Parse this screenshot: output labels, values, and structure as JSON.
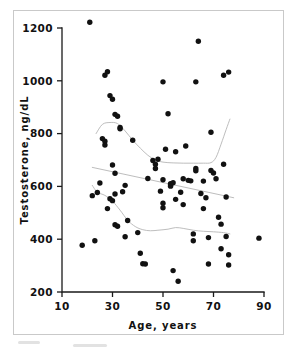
{
  "figure": {
    "type": "scatter-plot",
    "background_color": "#ffffff",
    "frame_color": "#c9c9c9",
    "point_color": "#111111",
    "trend_color": "#b5b5b5"
  },
  "chart_data": {
    "type": "scatter",
    "title": "",
    "xlabel": "Age, years",
    "ylabel": "Testosterone, ng/dL",
    "xlim": [
      10,
      90
    ],
    "ylim": [
      200,
      1200
    ],
    "xticks": [
      10,
      30,
      50,
      70,
      90
    ],
    "yticks": [
      200,
      400,
      600,
      800,
      1000,
      1200
    ],
    "xtick_labels": [
      "10",
      "30",
      "50",
      "70",
      "90"
    ],
    "ytick_labels": [
      "200",
      "400",
      "600",
      "800",
      "1000",
      "1200"
    ],
    "grid": false,
    "legend": "none",
    "marker": "filled-circle",
    "points": [
      [
        21,
        1222
      ],
      [
        18,
        377
      ],
      [
        22,
        565
      ],
      [
        23,
        394
      ],
      [
        24,
        577
      ],
      [
        25,
        613
      ],
      [
        26,
        781
      ],
      [
        27,
        1021
      ],
      [
        27,
        771
      ],
      [
        27,
        757
      ],
      [
        28,
        1034
      ],
      [
        28,
        516
      ],
      [
        29,
        944
      ],
      [
        29,
        553
      ],
      [
        30,
        930
      ],
      [
        30,
        681
      ],
      [
        30,
        546
      ],
      [
        31,
        873
      ],
      [
        31,
        650
      ],
      [
        31,
        571
      ],
      [
        31,
        455
      ],
      [
        32,
        866
      ],
      [
        32,
        449
      ],
      [
        33,
        823
      ],
      [
        33,
        818
      ],
      [
        34,
        580
      ],
      [
        35,
        604
      ],
      [
        35,
        409
      ],
      [
        36,
        471
      ],
      [
        38,
        775
      ],
      [
        40,
        425
      ],
      [
        41,
        347
      ],
      [
        42,
        307
      ],
      [
        43,
        306
      ],
      [
        44,
        630
      ],
      [
        46,
        698
      ],
      [
        47,
        684
      ],
      [
        47,
        668
      ],
      [
        48,
        703
      ],
      [
        49,
        582
      ],
      [
        50,
        996
      ],
      [
        50,
        625
      ],
      [
        50,
        519
      ],
      [
        50,
        536
      ],
      [
        51,
        741
      ],
      [
        52,
        875
      ],
      [
        53,
        610
      ],
      [
        53,
        606
      ],
      [
        53,
        601
      ],
      [
        54,
        614
      ],
      [
        54,
        281
      ],
      [
        55,
        731
      ],
      [
        55,
        551
      ],
      [
        56,
        241
      ],
      [
        57,
        578
      ],
      [
        58,
        629
      ],
      [
        58,
        531
      ],
      [
        59,
        753
      ],
      [
        60,
        623
      ],
      [
        61,
        621
      ],
      [
        62,
        420
      ],
      [
        62,
        394
      ],
      [
        63,
        996
      ],
      [
        63,
        668
      ],
      [
        63,
        659
      ],
      [
        64,
        1150
      ],
      [
        65,
        573
      ],
      [
        66,
        620
      ],
      [
        66,
        516
      ],
      [
        67,
        557
      ],
      [
        68,
        306
      ],
      [
        68,
        406
      ],
      [
        69,
        805
      ],
      [
        69,
        660
      ],
      [
        70,
        651
      ],
      [
        71,
        629
      ],
      [
        72,
        483
      ],
      [
        73,
        457
      ],
      [
        73,
        364
      ],
      [
        74,
        1021
      ],
      [
        74,
        684
      ],
      [
        75,
        560
      ],
      [
        75,
        410
      ],
      [
        76,
        1033
      ],
      [
        76,
        341
      ],
      [
        76,
        302
      ],
      [
        88,
        404
      ]
    ],
    "trend_lines": [
      {
        "name": "upper-percentile",
        "points": [
          [
            23.5,
            800
          ],
          [
            26,
            835
          ],
          [
            29,
            842
          ],
          [
            32,
            838
          ],
          [
            35,
            810
          ],
          [
            38,
            775
          ],
          [
            41,
            745
          ],
          [
            44,
            718
          ],
          [
            47,
            700
          ],
          [
            50,
            692
          ],
          [
            54,
            689
          ],
          [
            58,
            688
          ],
          [
            62,
            688
          ],
          [
            66,
            688
          ],
          [
            69,
            690
          ],
          [
            71,
            710
          ],
          [
            73,
            760
          ],
          [
            75,
            815
          ],
          [
            76.5,
            855
          ]
        ]
      },
      {
        "name": "median-regression",
        "points": [
          [
            22,
            672
          ],
          [
            40,
            636
          ],
          [
            60,
            595
          ],
          [
            78,
            557
          ]
        ]
      },
      {
        "name": "lower-percentile",
        "points": [
          [
            22,
            604
          ],
          [
            24,
            578
          ],
          [
            27,
            566
          ],
          [
            30,
            544
          ],
          [
            33,
            510
          ],
          [
            36,
            472
          ],
          [
            39,
            448
          ],
          [
            42,
            436
          ],
          [
            45,
            432
          ],
          [
            48,
            434
          ],
          [
            52,
            438
          ],
          [
            55,
            444
          ],
          [
            58,
            441
          ],
          [
            62,
            434
          ],
          [
            66,
            430
          ],
          [
            70,
            428
          ],
          [
            74,
            425
          ],
          [
            76.5,
            420
          ]
        ]
      }
    ]
  }
}
